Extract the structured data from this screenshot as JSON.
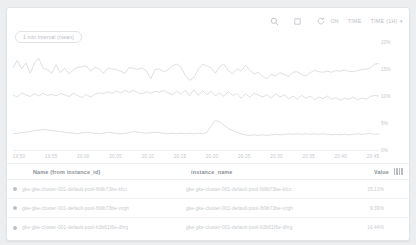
{
  "toolbar": {
    "search_icon": "search-icon",
    "expand_icon": "expand-icon",
    "refresh_icon": "refresh-icon",
    "auto_refresh_label": "ON",
    "time_label": "TIME",
    "time_range_label": "TIME (1H)",
    "caret": "▾"
  },
  "chart": {
    "interval_badge": "1 min interval (mean)"
  },
  "chart_data": {
    "type": "line",
    "title": "",
    "xlabel": "",
    "ylabel": "",
    "ylim": [
      0,
      20
    ],
    "ytick_labels": [
      "20%",
      "15%",
      "10%",
      "5%",
      "0%"
    ],
    "ytick_values": [
      20,
      15,
      10,
      5,
      0
    ],
    "grid": false,
    "legend_position": "table-below",
    "x_tick_labels": [
      "19:50",
      "19:55",
      "20:00",
      "20:05",
      "20:10",
      "20:15",
      "20:20",
      "20:25",
      "20:30",
      "20:35",
      "20:40",
      "20:45"
    ],
    "series": [
      {
        "name": "gke-gke-cluster-001-default-pool-fb9b73be-kfcx",
        "color": "#d9dde1",
        "values": [
          15.2,
          16.6,
          15.0,
          16.1,
          14.2,
          16.1,
          17.0,
          15.1,
          14.9,
          14.2,
          15.8,
          14.3,
          15.2,
          14.1,
          14.8,
          15.3,
          15.4,
          15.6,
          14.6,
          15.3,
          15.0,
          14.2,
          15.2,
          15.0,
          14.9,
          14.6,
          14.2,
          15.3,
          15.1,
          14.9,
          15.2,
          14.6,
          13.2,
          14.9,
          15.0,
          14.5,
          14.8,
          15.6,
          15.9,
          15.4,
          13.8,
          12.9,
          13.4,
          14.9,
          15.9,
          15.6,
          15.2,
          14.2,
          15.4,
          15.9,
          14.7,
          14.1,
          15.1,
          14.6,
          15.7,
          14.8,
          14.1,
          14.4,
          13.6,
          13.2,
          14.1,
          13.7,
          14.3,
          14.0,
          13.6,
          14.4,
          14.5,
          14.0,
          13.7,
          14.3,
          14.7,
          14.5,
          14.4,
          14.6,
          14.4,
          14.7,
          14.6,
          14.8,
          14.6,
          14.5,
          14.7,
          14.9,
          15.0,
          15.2,
          15.9,
          16.0
        ]
      },
      {
        "name": "gke-gke-cluster-001-default-pool-fb9b73be-vzgh",
        "color": "#d9dde1",
        "values": [
          10.2,
          9.8,
          10.6,
          10.2,
          9.9,
          10.4,
          10.0,
          10.5,
          10.1,
          10.3,
          10.0,
          10.5,
          10.2,
          9.9,
          10.5,
          10.1,
          9.7,
          10.3,
          9.8,
          10.3,
          10.6,
          10.4,
          10.8,
          10.5,
          10.9,
          10.6,
          11.0,
          10.7,
          11.0,
          10.6,
          10.4,
          10.8,
          10.5,
          10.9,
          10.7,
          11.0,
          10.6,
          10.2,
          10.9,
          10.3,
          11.1,
          10.0,
          11.2,
          10.1,
          11.0,
          10.2,
          10.9,
          10.0,
          10.6,
          9.9,
          10.8,
          10.1,
          10.5,
          9.6,
          10.4,
          9.8,
          10.5,
          10.2,
          9.8,
          10.3,
          9.6,
          10.4,
          9.8,
          10.2,
          9.5,
          10.0,
          9.4,
          10.1,
          9.6,
          10.0,
          9.3,
          9.8,
          9.5,
          10.0,
          9.4,
          9.7,
          9.2,
          9.6,
          9.4,
          9.8,
          9.3,
          9.6,
          9.4,
          9.9,
          10.1,
          10.0
        ]
      },
      {
        "name": "gke-gke-cluster-001-default-pool-b3b61f6e-dhrg",
        "color": "#d9dde1",
        "values": [
          3.0,
          3.1,
          3.2,
          3.3,
          3.4,
          3.6,
          3.7,
          3.8,
          3.7,
          3.6,
          3.5,
          3.4,
          3.3,
          3.2,
          3.1,
          3.0,
          3.2,
          3.3,
          3.2,
          3.1,
          3.0,
          3.1,
          3.3,
          3.2,
          3.1,
          3.0,
          3.1,
          3.2,
          3.4,
          3.3,
          3.2,
          3.1,
          3.2,
          3.3,
          3.2,
          3.1,
          3.0,
          3.1,
          3.0,
          3.1,
          3.0,
          3.1,
          3.0,
          3.1,
          3.0,
          3.3,
          4.4,
          5.5,
          5.2,
          4.6,
          4.0,
          3.6,
          3.3,
          3.0,
          2.8,
          2.7,
          2.8,
          2.7,
          2.8,
          2.7,
          2.8,
          2.9,
          2.8,
          2.9,
          3.0,
          2.9,
          3.0,
          2.9,
          3.0,
          2.9,
          3.0,
          2.9,
          3.0,
          2.9,
          2.8,
          2.9,
          2.8,
          2.9,
          2.8,
          2.9,
          3.0,
          2.9,
          3.0,
          3.1,
          2.9,
          3.0
        ]
      }
    ]
  },
  "table": {
    "columns": {
      "name": "Name (from instance_id)",
      "instance": "instance_name",
      "value": "Value",
      "settings_icon": "columns-settings-icon"
    },
    "rows": [
      {
        "dot_color": "#bdc1c6",
        "name": "gke-gke-cluster-001-default-pool-fb9b73be-kfcx",
        "instance": "gke-gke-cluster-001-default-pool-fb9b73be-kfcx",
        "value": "15.13%"
      },
      {
        "dot_color": "#bdc1c6",
        "name": "gke-gke-cluster-001-default-pool-fb9b73be-vzgh",
        "instance": "gke-gke-cluster-001-default-pool-fb9b73be-vzgh",
        "value": "9.39%"
      },
      {
        "dot_color": "#bdc1c6",
        "name": "gke-gke-cluster-001-default-pool-b3b61f6e-dhrg",
        "instance": "gke-gke-cluster-001-default-pool-b3b61f6e-dhrg",
        "value": "16.44%"
      }
    ]
  }
}
